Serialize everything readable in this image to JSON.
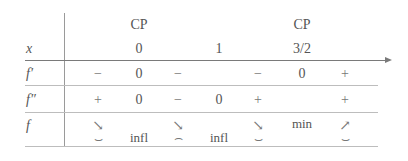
{
  "table": {
    "header_cp": [
      "CP",
      "CP"
    ],
    "x_label": "x",
    "x_values": [
      "0",
      "1",
      "3/2"
    ],
    "rows": {
      "fprime": {
        "label": "f′",
        "cells": [
          "−",
          "0",
          "−",
          "−",
          "0",
          "+"
        ]
      },
      "fdoubleprime": {
        "label": "f″",
        "cells": [
          "+",
          "0",
          "−",
          "0",
          "+",
          "+"
        ]
      },
      "f": {
        "label": "f",
        "cells": [
          "↘",
          "↘",
          "↘",
          "min",
          "↗"
        ]
      },
      "concavity": {
        "cells": [
          "⌣",
          "infl",
          "⌢",
          "infl",
          "⌣",
          "⌣"
        ]
      }
    }
  }
}
